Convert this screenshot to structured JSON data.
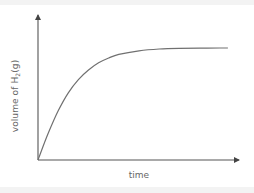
{
  "chart_data": {
    "type": "line",
    "title": "",
    "xlabel": "time",
    "ylabel": "volume of H2(g)",
    "ylabel_parts": {
      "prefix": "volume of H",
      "subscript": "2",
      "suffix": "(g)"
    },
    "x_ticks": [],
    "y_ticks": [],
    "grid": false,
    "legend": null,
    "axes_arrows": true,
    "series": [
      {
        "name": "volume of H2(g)",
        "color": "#707070",
        "description": "rises steeply from origin, curves and levels off to a plateau",
        "x": [
          0,
          0.05,
          0.1,
          0.15,
          0.2,
          0.25,
          0.3,
          0.35,
          0.4,
          0.5,
          0.6,
          0.7,
          0.8,
          0.9,
          0.94
        ],
        "y": [
          0,
          0.22,
          0.41,
          0.56,
          0.67,
          0.75,
          0.81,
          0.85,
          0.88,
          0.91,
          0.925,
          0.93,
          0.932,
          0.933,
          0.933
        ]
      }
    ],
    "xlim": [
      0,
      1
    ],
    "ylim": [
      0,
      1
    ]
  },
  "colors": {
    "axis": "#555555",
    "curve": "#707070",
    "label": "#666666",
    "band": "#f3f3f3"
  }
}
